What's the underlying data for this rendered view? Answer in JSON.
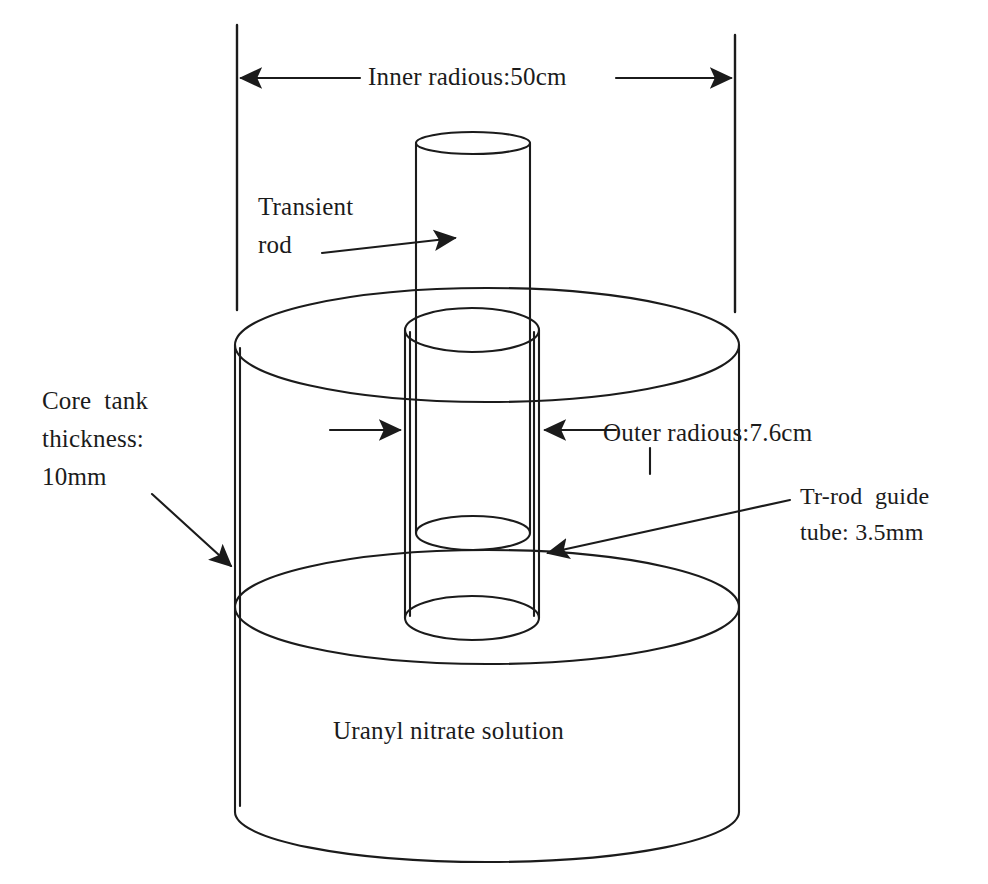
{
  "figure": {
    "background_color": "#ffffff",
    "line_color": "#1b1b1b",
    "text_color": "#1b1b1b"
  },
  "labels": {
    "inner_radius": "Inner radious:50cm",
    "transient_rod_line1": "Transient",
    "transient_rod_line2": "rod",
    "core_tank_line1": "Core  tank",
    "core_tank_line2": "thickness:",
    "core_tank_line3": "10mm",
    "outer_radius": "Outer radious:7.6cm",
    "guide_tube_line1": "Tr-rod  guide",
    "guide_tube_line2": "tube: 3.5mm",
    "solution": "Uranyl nitrate solution"
  },
  "dimensions": {
    "inner_radius_value": "50cm",
    "outer_radius_value": "7.6cm",
    "core_tank_thickness": "10mm",
    "guide_tube_thickness": "3.5mm"
  },
  "parts": {
    "core_tank": "Core tank",
    "transient_rod": "Transient rod",
    "guide_tube": "Tr-rod guide tube",
    "solution": "Uranyl nitrate solution"
  }
}
